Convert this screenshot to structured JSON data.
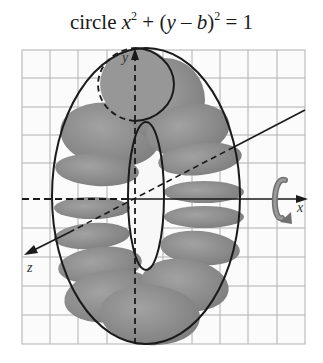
{
  "title": {
    "prefix": "circle ",
    "x": "x",
    "x_exp": "2",
    "mid": " + (",
    "y": "y",
    "minus": " – ",
    "b": "b",
    "close": ")",
    "close_exp": "2",
    "rhs": " = 1"
  },
  "axes": {
    "x_label": "x",
    "y_label": "y",
    "z_label": "z"
  },
  "colors": {
    "grid": "#a8a8a8",
    "ellipse_fill": "#8a8a8a",
    "outline": "#1a1a1a",
    "arrow_icon": "#7a7a7a"
  },
  "figure": {
    "rotation_icon": "rotation-arrow-about-x-axis"
  }
}
